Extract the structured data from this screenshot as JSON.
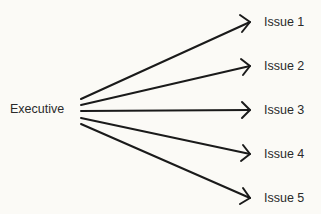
{
  "diagram": {
    "source": {
      "label": "Executive"
    },
    "targets": [
      {
        "label": "Issue 1"
      },
      {
        "label": "Issue 2"
      },
      {
        "label": "Issue 3"
      },
      {
        "label": "Issue 4"
      },
      {
        "label": "Issue 5"
      }
    ],
    "colors": {
      "line": "#1a1a1a",
      "background": "#fbfaf6",
      "text": "#2a2a2a"
    }
  }
}
